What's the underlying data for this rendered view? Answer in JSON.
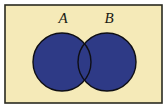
{
  "diagram": {
    "type": "venn",
    "frame": {
      "x": 5,
      "y": 5,
      "width": 157,
      "height": 98,
      "fill": "#f5eab8",
      "stroke": "#2a2a20"
    },
    "sets": [
      {
        "label": "A",
        "cx": 62,
        "cy": 62,
        "r": 29,
        "fill": "#2e3a86",
        "stroke": "#0e0e14",
        "label_x": 63,
        "label_y": 23
      },
      {
        "label": "B",
        "cx": 107,
        "cy": 62,
        "r": 29,
        "fill": "#2e3a86",
        "stroke": "#0e0e14",
        "label_x": 109,
        "label_y": 23
      }
    ],
    "shaded_region": "A ∪ B"
  }
}
